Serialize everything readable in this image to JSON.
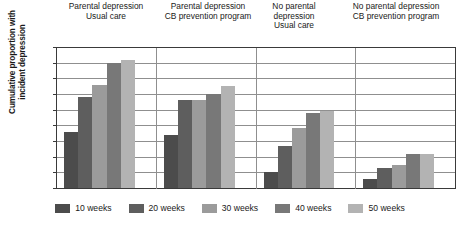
{
  "chart_data": {
    "type": "bar",
    "title": "",
    "xlabel": "",
    "ylabel": "Cumulative proportion with incident depression",
    "ylabel_lines": [
      "Cumulative proportion with",
      "incident depression"
    ],
    "ylim": [
      0,
      0.45
    ],
    "yticks": [
      "0",
      "0.05",
      "0.1",
      "0.15",
      "0.2",
      "0.25",
      "0.3",
      "0.35",
      "0.4",
      "0.45"
    ],
    "ytick_values": [
      0,
      0.05,
      0.1,
      0.15,
      0.2,
      0.25,
      0.3,
      0.35,
      0.4,
      0.45
    ],
    "grid": true,
    "legend_position": "bottom",
    "categories": [
      "Parental depression Usual care",
      "Parental depression CB prevention program",
      "No parental depression Usual care",
      "No parental depression CB prevention program"
    ],
    "category_label_lines": [
      [
        "Parental depression",
        "Usual care"
      ],
      [
        "Parental depression",
        "CB prevention program"
      ],
      [
        "No parental",
        "depression",
        "Usual care"
      ],
      [
        "No parental depression",
        "CB prevention program"
      ]
    ],
    "series": [
      {
        "name": "10 weeks",
        "color": "#4c4c4c",
        "values": [
          0.18,
          0.17,
          0.05,
          0.03
        ]
      },
      {
        "name": "20 weeks",
        "color": "#5e5e5e",
        "values": [
          0.29,
          0.28,
          0.135,
          0.065
        ]
      },
      {
        "name": "30 weeks",
        "color": "#9b9b9b",
        "values": [
          0.33,
          0.28,
          0.19,
          0.075
        ]
      },
      {
        "name": "40 weeks",
        "color": "#787878",
        "values": [
          0.4,
          0.3,
          0.24,
          0.11
        ]
      },
      {
        "name": "50 weeks",
        "color": "#b3b3b3",
        "values": [
          0.41,
          0.325,
          0.245,
          0.11
        ]
      }
    ]
  },
  "colors": {
    "axis": "#3a3a3a",
    "grid": "#8f8f8f",
    "background": "#ffffff",
    "text": "#1a1a1a"
  }
}
